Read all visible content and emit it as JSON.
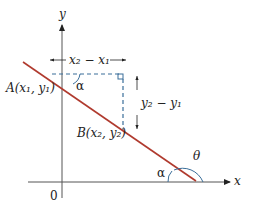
{
  "diagram": {
    "axes": {
      "x_label": "x",
      "y_label": "y",
      "origin_label": "0"
    },
    "points": {
      "A": "A(x₁, y₁)",
      "B": "B(x₂, y₂)"
    },
    "run_label": "x₂ − x₁",
    "rise_label": "y₂ − y₁",
    "angles": {
      "alpha_top": "α",
      "alpha_bottom": "α",
      "theta": "θ"
    },
    "colors": {
      "line": "#b03a2e",
      "dashed": "#3a6e9a",
      "axes": "#333333",
      "angle_arc": "#3a6e9a"
    }
  }
}
